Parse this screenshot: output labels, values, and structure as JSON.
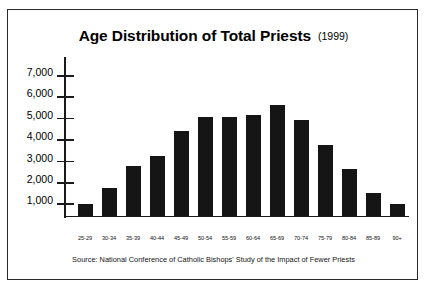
{
  "chart_data": {
    "type": "bar",
    "title": "Age Distribution of Total Priests",
    "title_suffix": "(1999)",
    "xlabel": "",
    "ylabel": "",
    "categories": [
      "25-29",
      "30-34",
      "35-39",
      "40-44",
      "45-49",
      "50-54",
      "55-59",
      "60-64",
      "65-69",
      "70-74",
      "75-79",
      "80-84",
      "85-89",
      "90+"
    ],
    "values": [
      600,
      1400,
      2500,
      3000,
      4200,
      4900,
      4900,
      5000,
      5500,
      4750,
      3550,
      2350,
      1150,
      600
    ],
    "ylim": [
      0,
      7000
    ],
    "ytick_labels": [
      "7,000",
      "6,000",
      "5,000",
      "4,000",
      "3,000",
      "2,000",
      "1,000"
    ],
    "ytick_values": [
      7000,
      6000,
      5000,
      4000,
      3000,
      2000,
      1000
    ],
    "grid": false,
    "legend": null,
    "bar_color": "#151515",
    "axis_color": "#1a1a1a",
    "source": "Source: National Conference of Catholic Bishops' Study of the Impact of Fewer Priests"
  }
}
